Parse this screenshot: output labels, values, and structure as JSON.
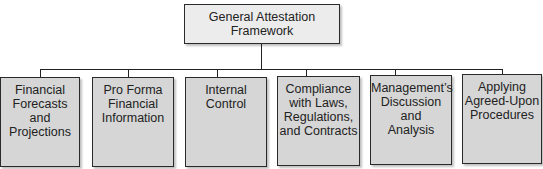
{
  "diagram": {
    "root": {
      "label": "General Attestation Framework"
    },
    "children": [
      {
        "label": "Financial Forecasts and Projections",
        "lines": [
          "Financial",
          "Forecasts and",
          "Projections"
        ]
      },
      {
        "label": "Pro Forma Financial Information",
        "lines": [
          "Pro Forma",
          "Financial",
          "Information"
        ]
      },
      {
        "label": "Internal Control",
        "lines": [
          "Internal",
          "Control"
        ]
      },
      {
        "label": "Compliance with Laws, Regulations, and Contracts",
        "lines": [
          "Compliance",
          "with Laws,",
          "Regulations,",
          "and Contracts"
        ]
      },
      {
        "label": "Management's Discussion and Analysis",
        "lines": [
          "Management’s",
          "Discussion and",
          "Analysis"
        ]
      },
      {
        "label": "Applying Agreed-Upon Procedures",
        "lines": [
          "Applying",
          "Agreed-Upon",
          "Procedures"
        ]
      }
    ]
  }
}
